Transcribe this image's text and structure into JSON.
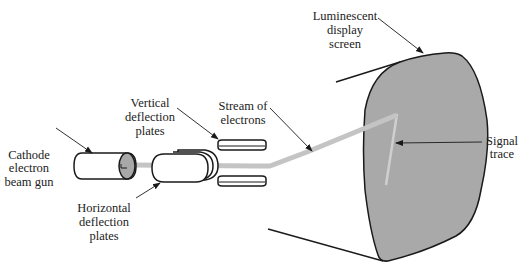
{
  "diagram": {
    "labels": {
      "gun": [
        "Cathode",
        "electron",
        "beam gun"
      ],
      "vertical": [
        "Vertical",
        "deflection",
        "plates"
      ],
      "stream": [
        "Stream of",
        "electrons"
      ],
      "screen": [
        "Luminescent",
        "display",
        "screen"
      ],
      "signal": [
        "Signal",
        "trace"
      ],
      "horizontal": [
        "Horizontal",
        "deflection",
        "plates"
      ]
    },
    "colors": {
      "screen_fill": "#a9a9a9",
      "beam": "#c4c4c4",
      "outline": "#1a1a1a",
      "gun_face": "#a8a8a8"
    }
  }
}
